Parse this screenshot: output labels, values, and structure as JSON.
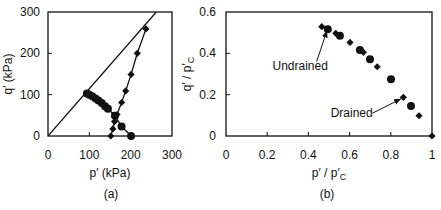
{
  "chart_data": [
    {
      "id": "a",
      "type": "scatter",
      "title": "",
      "panel_label": "(a)",
      "xlabel": "p′ (kPa)",
      "ylabel": "q′ (kPa)",
      "xlim": [
        0,
        300
      ],
      "ylim": [
        0,
        300
      ],
      "xticks": [
        0,
        100,
        200,
        300
      ],
      "yticks": [
        0,
        100,
        200,
        300
      ],
      "xtick_labels": [
        "0",
        "100",
        "200",
        "300"
      ],
      "ytick_labels": [
        "0",
        "100",
        "200",
        "300"
      ],
      "grid": false,
      "legend": null,
      "series": [
        {
          "name": "Critical state line",
          "kind": "line",
          "marker": "none",
          "points": [
            [
              0,
              0
            ],
            [
              262,
              300
            ]
          ]
        },
        {
          "name": "Undrained",
          "kind": "line+marker",
          "marker": "circle",
          "points": [
            [
              94,
              103
            ],
            [
              100,
              100
            ],
            [
              107,
              96
            ],
            [
              115,
              91
            ],
            [
              122,
              86
            ],
            [
              130,
              80
            ],
            [
              138,
              72
            ],
            [
              145,
              66
            ],
            [
              162,
              49
            ],
            [
              178,
              23
            ],
            [
              201,
              0
            ]
          ]
        },
        {
          "name": "Drained",
          "kind": "line+marker",
          "marker": "diamond",
          "points": [
            [
              152,
              0
            ],
            [
              157,
              17
            ],
            [
              161,
              35
            ],
            [
              167,
              52
            ],
            [
              178,
              81
            ],
            [
              188,
              109
            ],
            [
              201,
              149
            ],
            [
              216,
              200
            ],
            [
              237,
              259
            ]
          ]
        }
      ]
    },
    {
      "id": "b",
      "type": "scatter",
      "title": "",
      "panel_label": "(b)",
      "xlabel": "p′ / p′C",
      "xlabel_main": "p′ / p′",
      "xlabel_sub": "C",
      "ylabel": "q′ / p′C",
      "ylabel_main": "q′ / p′",
      "ylabel_sub": "C",
      "xlim": [
        0,
        1
      ],
      "ylim": [
        0,
        0.6
      ],
      "xticks": [
        0,
        0.2,
        0.4,
        0.6,
        0.8,
        1
      ],
      "yticks": [
        0,
        0.2,
        0.4,
        0.6
      ],
      "xtick_labels": [
        "0",
        "0.2",
        "0.4",
        "0.6",
        "0.8",
        "1"
      ],
      "ytick_labels": [
        "0",
        "0.2",
        "0.4",
        "0.6"
      ],
      "grid": false,
      "legend": null,
      "series": [
        {
          "name": "Undrained",
          "kind": "marker",
          "marker": "circle",
          "points": [
            [
              0.494,
              0.516
            ],
            [
              0.553,
              0.485
            ],
            [
              0.65,
              0.416
            ],
            [
              0.699,
              0.371
            ],
            [
              0.801,
              0.274
            ],
            [
              0.898,
              0.145
            ]
          ]
        },
        {
          "name": "Drained",
          "kind": "marker",
          "marker": "diamond",
          "points": [
            [
              0.465,
              0.529
            ],
            [
              0.533,
              0.497
            ],
            [
              0.602,
              0.453
            ],
            [
              0.667,
              0.405
            ],
            [
              0.734,
              0.335
            ],
            [
              0.861,
              0.187
            ],
            [
              0.937,
              0.098
            ],
            [
              1.0,
              0.0
            ]
          ]
        }
      ],
      "annotations": [
        {
          "text": "Undrained",
          "text_xy": [
            0.36,
            0.32
          ],
          "arrow_from": [
            0.44,
            0.36
          ],
          "arrow_to": [
            0.49,
            0.51
          ]
        },
        {
          "text": "Drained",
          "text_xy": [
            0.61,
            0.09
          ],
          "arrow_from": [
            0.71,
            0.11
          ],
          "arrow_to": [
            0.85,
            0.18
          ]
        }
      ]
    }
  ],
  "colors": {
    "ink": "#111111",
    "background": "#ffffff"
  }
}
